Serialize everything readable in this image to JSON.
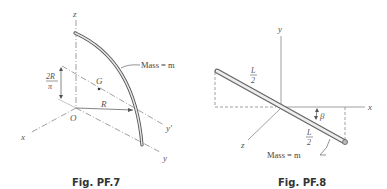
{
  "figures": [
    {
      "caption": "Fig. PF.7",
      "labels": {
        "z_axis": "z",
        "x_axis": "x",
        "y_axis": "y",
        "y_prime_axis": "y'",
        "origin": "O",
        "centroid": "G",
        "radius": "R",
        "height_num": "2R",
        "height_den": "π",
        "mass": "Mass = m"
      }
    },
    {
      "caption": "Fig. PF.8",
      "labels": {
        "y_axis": "y",
        "x_axis": "x",
        "z_axis": "z",
        "half_len_top_num": "L",
        "half_len_top_den": "2",
        "half_len_bot_num": "L",
        "half_len_bot_den": "2",
        "angle": "β",
        "mass": "Mass = m"
      }
    }
  ]
}
